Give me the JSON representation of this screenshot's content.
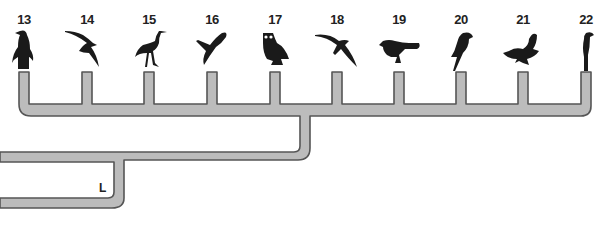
{
  "diagram": {
    "type": "cladogram",
    "pipe_fill": "#bcbcbc",
    "pipe_stroke": "#555555",
    "node_label": "L",
    "taxa": [
      {
        "number": "13",
        "icon": "penguin-icon"
      },
      {
        "number": "14",
        "icon": "albatross-icon"
      },
      {
        "number": "15",
        "icon": "heron-icon"
      },
      {
        "number": "16",
        "icon": "gull-icon"
      },
      {
        "number": "17",
        "icon": "owl-icon"
      },
      {
        "number": "18",
        "icon": "swift-icon"
      },
      {
        "number": "19",
        "icon": "songbird-icon"
      },
      {
        "number": "20",
        "icon": "parrot-icon"
      },
      {
        "number": "21",
        "icon": "cuckoo-icon"
      },
      {
        "number": "22",
        "icon": "shrike-icon"
      }
    ]
  }
}
